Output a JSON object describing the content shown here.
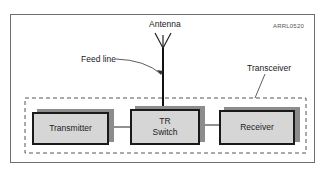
{
  "diagram": {
    "figure_id": "ARRL0520",
    "labels": {
      "antenna": "Antenna",
      "feed_line": "Feed line",
      "transceiver": "Transceiver"
    },
    "blocks": [
      {
        "id": "transmitter",
        "lines": [
          "Transmitter"
        ]
      },
      {
        "id": "tr_switch",
        "lines": [
          "TR",
          "Switch"
        ]
      },
      {
        "id": "receiver",
        "lines": [
          "Receiver"
        ]
      }
    ],
    "connections": [
      {
        "from": "transmitter",
        "to": "tr_switch"
      },
      {
        "from": "tr_switch",
        "to": "receiver"
      },
      {
        "from": "tr_switch",
        "to": "antenna",
        "label": "Feed line"
      }
    ],
    "group": {
      "label": "Transceiver",
      "contains": [
        "transmitter",
        "tr_switch",
        "receiver"
      ],
      "style": "dashed"
    },
    "colors": {
      "block_fill": "#d6d6d6",
      "block_shadow": "#8c8c8c",
      "border": "#1a1a1a",
      "frame": "#6f6f6f"
    }
  }
}
